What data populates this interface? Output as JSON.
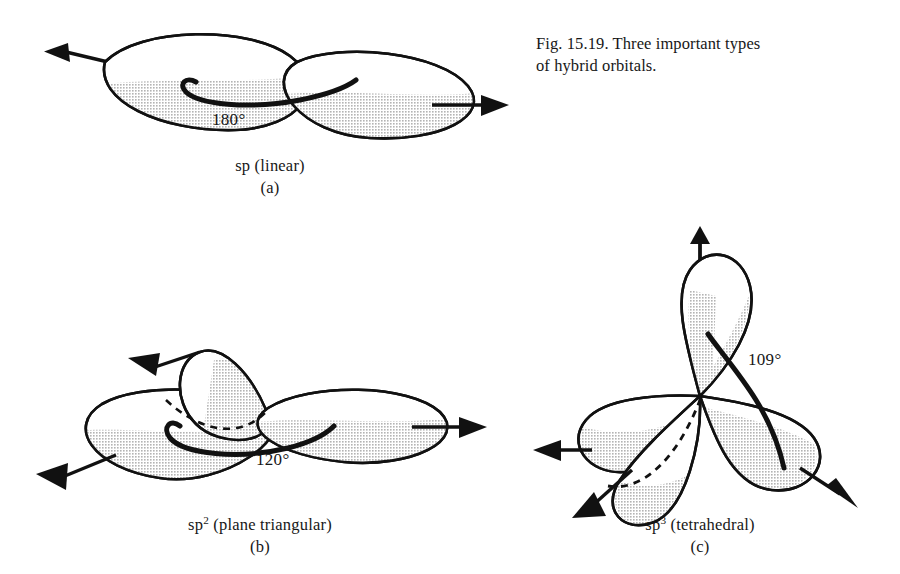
{
  "figure": {
    "caption_line1": "Fig. 15.19.  Three important types",
    "caption_line2": "of hybrid orbitals.",
    "colors": {
      "outline": "#111111",
      "shade": "#c9c9c9",
      "background": "#ffffff",
      "text": "#171717"
    }
  },
  "panels": [
    {
      "id": "a",
      "label_main_prefix": "sp",
      "label_main_superscript": "",
      "label_main_suffix": " (linear)",
      "label_main": "sp  (linear)",
      "label_sub": "(a)",
      "angle": "180°",
      "lobe_count": 2,
      "geometry_name": "linear"
    },
    {
      "id": "b",
      "label_main_prefix": "sp",
      "label_main_superscript": "2",
      "label_main_suffix": " (plane  triangular)",
      "label_main": "sp2 (plane  triangular)",
      "label_sub": "(b)",
      "angle": "120°",
      "lobe_count": 3,
      "geometry_name": "plane triangular"
    },
    {
      "id": "c",
      "label_main_prefix": "sp",
      "label_main_superscript": "3",
      "label_main_suffix": " (tetrahedral)",
      "label_main": "sp3 (tetrahedral)",
      "label_sub": "(c)",
      "angle": "109°",
      "lobe_count": 4,
      "geometry_name": "tetrahedral"
    }
  ]
}
